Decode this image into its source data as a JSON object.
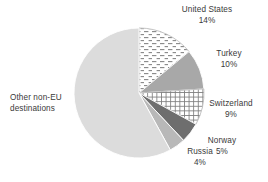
{
  "chart_data": {
    "type": "pie",
    "title": "",
    "xlabel": "",
    "ylabel": "",
    "legend_position": "none",
    "grid": false,
    "value_unit": "percent",
    "start_angle_deg": 0,
    "direction": "clockwise",
    "categories": [
      "United States",
      "Turkey",
      "Switzerland",
      "Norway",
      "Russia",
      "Other non-EU destinations"
    ],
    "values": [
      14,
      10,
      9,
      5,
      4,
      58
    ],
    "slices": [
      {
        "name": "United States",
        "value": 14,
        "label_name": "United States",
        "label_value": "14%",
        "fill": "#ffffff",
        "pattern": "dashed-brick",
        "pattern_color": "#8c8c8c",
        "stroke": "#bdbdbd"
      },
      {
        "name": "Turkey",
        "value": 10,
        "label_name": "Turkey",
        "label_value": "10%",
        "fill": "#a8a8a8",
        "pattern": "solid",
        "pattern_color": "",
        "stroke": "#ffffff"
      },
      {
        "name": "Switzerland",
        "value": 9,
        "label_name": "Switzerland",
        "label_value": "9%",
        "fill": "#ffffff",
        "pattern": "grid",
        "pattern_color": "#7d7d7d",
        "stroke": "#bdbdbd"
      },
      {
        "name": "Norway",
        "value": 5,
        "label_name": "Norway",
        "label_value": "5%",
        "fill": "#6e6e6e",
        "pattern": "solid",
        "pattern_color": "",
        "stroke": "#ffffff"
      },
      {
        "name": "Russia",
        "value": 4,
        "label_name": "Russia",
        "label_value": "4%",
        "fill": "#b8b8b8",
        "pattern": "solid",
        "pattern_color": "",
        "stroke": "#ffffff"
      },
      {
        "name": "Other non-EU destinations",
        "value": 58,
        "label_name_line1": "Other non-EU",
        "label_name_line2": "destinations",
        "label_value": "",
        "fill": "#dcdcdc",
        "pattern": "solid",
        "pattern_color": "",
        "stroke": "#ffffff"
      }
    ]
  },
  "labels": {
    "united_states": {
      "name": "United States",
      "percent": "14%"
    },
    "turkey": {
      "name": "Turkey",
      "percent": "10%"
    },
    "switzerland": {
      "name": "Switzerland",
      "percent": "9%"
    },
    "norway": {
      "name": "Norway",
      "percent": "5%"
    },
    "russia": {
      "name": "Russia",
      "percent": "4%"
    },
    "other": {
      "line1": "Other non-EU",
      "line2": "destinations"
    }
  },
  "colors": {
    "background": "#ffffff",
    "text": "#3a3a3a",
    "other_slice": "#dcdcdc",
    "turkey_slice": "#a8a8a8",
    "norway_slice": "#6e6e6e",
    "russia_slice": "#b8b8b8",
    "pattern_line": "#8c8c8c"
  }
}
